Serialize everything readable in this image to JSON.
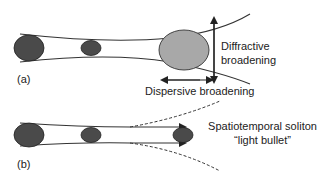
{
  "panel_a": {
    "label": "(a)",
    "diffractive_label_line1": "Diffractive",
    "diffractive_label_line2": "broadening",
    "dispersive_label": "Dispersive broadening"
  },
  "panel_b": {
    "label": "(b)",
    "soliton_label_line1": "Spatiotemporal soliton",
    "soliton_label_line2": "“light bullet”"
  },
  "colors": {
    "pulse_dark": "#4a4a4a",
    "pulse_light": "#a8a8a8",
    "line": "#333333",
    "text": "#222222"
  }
}
